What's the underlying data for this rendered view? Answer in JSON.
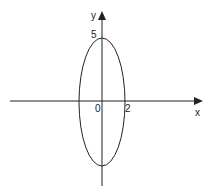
{
  "diagram": {
    "type": "ellipse-on-axes",
    "labels": {
      "x_axis": "x",
      "y_axis": "y",
      "origin": "0",
      "semi_major_tick": "5",
      "semi_minor_tick": "2"
    },
    "ellipse": {
      "a": 2,
      "b": 5
    },
    "colors": {
      "stroke": "#222222",
      "background": "#ffffff"
    }
  }
}
